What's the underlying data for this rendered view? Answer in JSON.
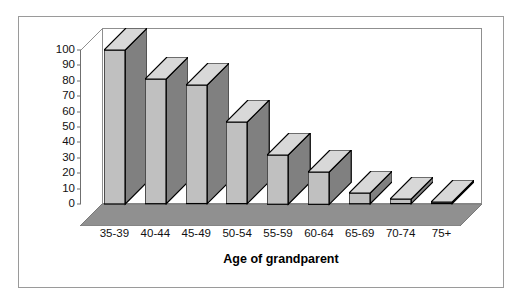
{
  "chart_data": {
    "type": "bar",
    "title": "",
    "xlabel": "Age of grandparent",
    "ylabel": "%",
    "categories": [
      "35-39",
      "40-44",
      "45-49",
      "50-54",
      "55-59",
      "60-64",
      "65-69",
      "70-74",
      "75+"
    ],
    "values": [
      100,
      81,
      77,
      53,
      32,
      21,
      7,
      3,
      1
    ],
    "ylim": [
      0,
      100
    ],
    "yticks": [
      0,
      10,
      20,
      30,
      40,
      50,
      60,
      70,
      80,
      90,
      100
    ],
    "ytick_labels": [
      "0",
      "10",
      "20",
      "30",
      "40",
      "50",
      "60",
      "70",
      "80",
      "90",
      "100"
    ],
    "grid": false,
    "legend": null,
    "style": "3d-column",
    "colors": {
      "bar_front": "#c0c0c0",
      "bar_side": "#808080",
      "bar_top": "#d8d8d8",
      "bar_outline": "#000000",
      "floor": "#909090",
      "floor_top": "#a8a8a8",
      "axis": "#6f6f6f",
      "frame": "#9a9a9a",
      "text": "#111111",
      "background": "#ffffff"
    }
  },
  "figure": {
    "y_axis_title": "%",
    "x_axis_title": "Age of grandparent"
  }
}
